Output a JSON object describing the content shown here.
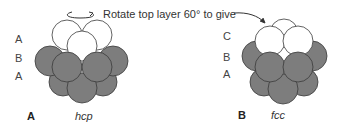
{
  "instruction": "Rotate top layer 60° to give",
  "colors": {
    "grey_sphere": "#7d7d7d",
    "white_sphere": "#ffffff",
    "outline": "#3a3a3a"
  },
  "panels": [
    {
      "id": "A",
      "label": "A",
      "caption": "hcp",
      "layers": [
        "A",
        "B",
        "A"
      ]
    },
    {
      "id": "B",
      "label": "B",
      "caption": "fcc",
      "layers": [
        "C",
        "B",
        "A"
      ]
    }
  ],
  "icons": {
    "rotate": "rotation-arrow-icon",
    "pointer": "curved-arrow-icon"
  }
}
